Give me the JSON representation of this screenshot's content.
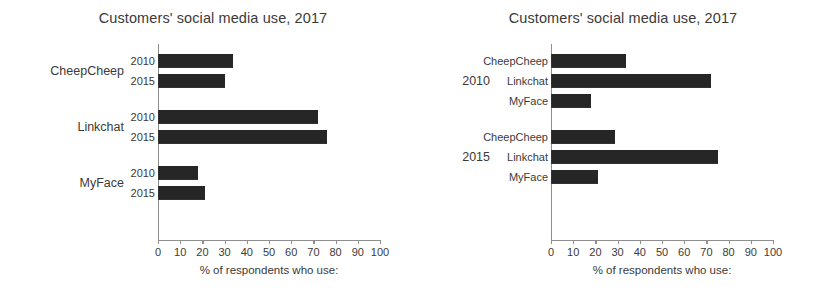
{
  "figures": [
    {
      "id": "left",
      "title": "Customers' social media use, 2017",
      "grouping": "by-platform",
      "outer_labels": [
        "CheepCheep",
        "Linkchat",
        "MyFace"
      ],
      "inner_labels": [
        "2010",
        "2015"
      ],
      "axis_caption": "% of respondents who use:",
      "ticks": [
        "0",
        "10",
        "20",
        "30",
        "40",
        "50",
        "60",
        "70",
        "80",
        "90",
        "100"
      ],
      "groups": [
        {
          "name": "CheepCheep",
          "bars": [
            {
              "label": "2010",
              "value": 34
            },
            {
              "label": "2015",
              "value": 30
            }
          ]
        },
        {
          "name": "Linkchat",
          "bars": [
            {
              "label": "2010",
              "value": 72
            },
            {
              "label": "2015",
              "value": 76
            }
          ]
        },
        {
          "name": "MyFace",
          "bars": [
            {
              "label": "2010",
              "value": 18
            },
            {
              "label": "2015",
              "value": 21
            }
          ]
        }
      ]
    },
    {
      "id": "right",
      "title": "Customers' social media use, 2017",
      "grouping": "by-year",
      "outer_labels": [
        "2010",
        "2015"
      ],
      "inner_labels": [
        "CheepCheep",
        "Linkchat",
        "MyFace"
      ],
      "axis_caption": "% of respondents who use:",
      "ticks": [
        "0",
        "10",
        "20",
        "30",
        "40",
        "50",
        "60",
        "70",
        "80",
        "90",
        "100"
      ],
      "groups": [
        {
          "name": "2010",
          "bars": [
            {
              "label": "CheepCheep",
              "value": 34
            },
            {
              "label": "Linkchat",
              "value": 72
            },
            {
              "label": "MyFace",
              "value": 18
            }
          ]
        },
        {
          "name": "2015",
          "bars": [
            {
              "label": "CheepCheep",
              "value": 29
            },
            {
              "label": "Linkchat",
              "value": 75
            },
            {
              "label": "MyFace",
              "value": 21
            }
          ]
        }
      ]
    }
  ],
  "chart_data": [
    {
      "type": "bar",
      "orientation": "horizontal",
      "title": "Customers' social media use, 2017",
      "xlabel": "% of respondents who use:",
      "ylabel": "",
      "xlim": [
        0,
        100
      ],
      "xticks": [
        0,
        10,
        20,
        30,
        40,
        50,
        60,
        70,
        80,
        90,
        100
      ],
      "grid": false,
      "legend": "none",
      "grouping": "platform outer, year inner",
      "categories": [
        "CheepCheep",
        "Linkchat",
        "MyFace"
      ],
      "series": [
        {
          "name": "2010",
          "values": [
            34,
            72,
            18
          ]
        },
        {
          "name": "2015",
          "values": [
            30,
            76,
            21
          ]
        }
      ]
    },
    {
      "type": "bar",
      "orientation": "horizontal",
      "title": "Customers' social media use, 2017",
      "xlabel": "% of respondents who use:",
      "ylabel": "",
      "xlim": [
        0,
        100
      ],
      "xticks": [
        0,
        10,
        20,
        30,
        40,
        50,
        60,
        70,
        80,
        90,
        100
      ],
      "grid": false,
      "legend": "none",
      "grouping": "year outer, platform inner",
      "categories": [
        "2010",
        "2015"
      ],
      "series": [
        {
          "name": "CheepCheep",
          "values": [
            34,
            29
          ]
        },
        {
          "name": "Linkchat",
          "values": [
            72,
            75
          ]
        },
        {
          "name": "MyFace",
          "values": [
            18,
            21
          ]
        }
      ]
    }
  ],
  "style": {
    "bar_color": "#262626",
    "axis_color": "#8e8e8e",
    "text_color": "#3a3a3a",
    "background": "#ffffff"
  }
}
